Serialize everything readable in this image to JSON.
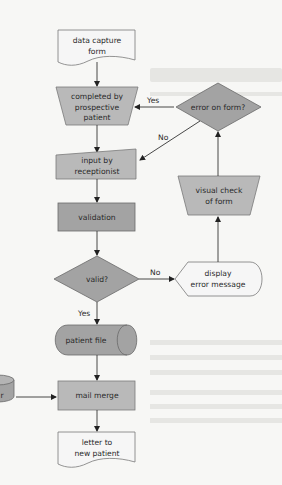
{
  "diagram": {
    "type": "flowchart",
    "nodes": {
      "data_capture_form": {
        "line1": "data capture",
        "line2": "form",
        "shape": "document"
      },
      "completed_by": {
        "line1": "completed by",
        "line2": "prospective",
        "line3": "patient",
        "shape": "manual-operation"
      },
      "error_on_form": {
        "label": "error on form?",
        "shape": "decision"
      },
      "input_by": {
        "line1": "input by",
        "line2": "receptionist",
        "shape": "manual-input"
      },
      "visual_check": {
        "line1": "visual check",
        "line2": "of form",
        "shape": "manual-operation"
      },
      "validation": {
        "label": "validation",
        "shape": "process"
      },
      "valid": {
        "label": "valid?",
        "shape": "decision"
      },
      "display_error": {
        "line1": "display",
        "line2": "error message",
        "shape": "display"
      },
      "patient_file": {
        "label": "patient file",
        "shape": "stored-data"
      },
      "mail_merge": {
        "label": "mail merge",
        "shape": "process"
      },
      "letter": {
        "line1": "letter to",
        "line2": "new patient",
        "shape": "document"
      },
      "partial_store": {
        "label": "r",
        "shape": "disk"
      }
    },
    "edges": {
      "error_yes": "Yes",
      "error_no": "No",
      "valid_no": "No",
      "valid_yes": "Yes"
    },
    "colors": {
      "light_fill": "#f6f6f6",
      "mid_fill": "#b9b9b9",
      "dark_fill": "#a3a3a3",
      "stroke": "#7a7a7a",
      "background": "#f7f7f5"
    }
  }
}
